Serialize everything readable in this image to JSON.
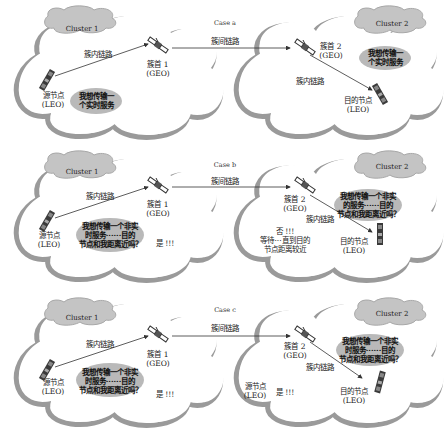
{
  "cases": [
    {
      "case_label": "Case a",
      "left_cluster": "Cluster 1",
      "right_cluster": "Cluster 2",
      "inter_link": "簇间链路",
      "left_intra_link": "簇内链路",
      "right_intra_link": "簇内链路",
      "head1": [
        "簇首 1",
        "(GEO)"
      ],
      "head2": [
        "簇首 2",
        "(GEO)"
      ],
      "source": [
        "源节点",
        "(LEO)"
      ],
      "dest": [
        "目的节点",
        "(LEO)"
      ],
      "left_bubble": [
        "我想传输一",
        "个实时服务"
      ],
      "right_bubble": [
        "我想传输一",
        "个实时服务"
      ]
    },
    {
      "case_label": "Case b",
      "left_cluster": "Cluster 1",
      "right_cluster": "Cluster 2",
      "inter_link": "簇间链路",
      "left_intra_link": "簇内链路",
      "right_intra_link": "簇内链路",
      "head1": [
        "簇首 1",
        "(GEO)"
      ],
      "head2": [
        "簇首 2",
        "(GEO)"
      ],
      "source": [
        "源节点",
        "(LEO)"
      ],
      "dest": [
        "目的节点",
        "(LEO)"
      ],
      "left_bubble": [
        "我想传输一个非实",
        "时服务······目的",
        "节点和我距离近吗？"
      ],
      "right_bubble": [
        "我想传输一个非实",
        "的服务······目的",
        "节点和我距离近吗？"
      ],
      "left_reply": "是 !!!",
      "right_reply": [
        "否 !!!",
        "等待···直到目的",
        "节点距离较近"
      ]
    },
    {
      "case_label": "Case c",
      "left_cluster": "Cluster 1",
      "right_cluster": "Cluster 2",
      "inter_link": "簇间链路",
      "left_intra_link": "簇内链路",
      "right_intra_link": "簇内链路",
      "head1": [
        "簇首 1",
        "(GEO)"
      ],
      "head2": [
        "簇首 2",
        "(GEO)"
      ],
      "source": [
        "源节点",
        "(LEO)"
      ],
      "dest": [
        "目的节点",
        "(LEO)"
      ],
      "left_bubble": [
        "我想传输一个非实",
        "时服务······目的",
        "节点和我距离近吗？"
      ],
      "right_bubble": [
        "我想传输一个非实",
        "时服务······目的",
        "节点和我距离近吗？"
      ],
      "left_reply": "是 !!!",
      "right_source": [
        "源节点",
        "(LEO)"
      ],
      "right_reply": "是 !!!"
    }
  ],
  "colors": {
    "cloud_outline": "#9a9a9a",
    "cloud_fill": "#ffffff",
    "cluster_label_fill": "#c8c8c8",
    "bubble_fill": "#b9b9b9",
    "link_line": "#333333"
  }
}
